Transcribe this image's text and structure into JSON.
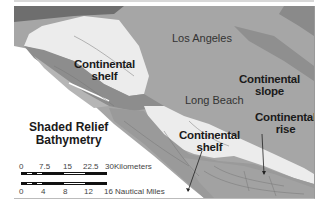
{
  "map": {
    "title_line1": "Shaded Relief",
    "title_line2": "Bathymetry",
    "labels": {
      "los_angeles": "Los Angeles",
      "long_beach": "Long Beach",
      "shelf_north_1": "Continental",
      "shelf_north_2": "shelf",
      "shelf_south_1": "Continental",
      "shelf_south_2": "shelf",
      "slope_1": "Continental",
      "slope_2": "slope",
      "rise_1": "Continental",
      "rise_2": "rise"
    },
    "scale_km": {
      "ticks": [
        "0",
        "7.5",
        "15",
        "22.5",
        "30"
      ],
      "unit": "Kilometers"
    },
    "scale_nm": {
      "ticks": [
        "0",
        "4",
        "8",
        "12",
        "16"
      ],
      "unit": "Nautical Miles"
    },
    "colors": {
      "land": "#a9a9a9",
      "shelf": "#ececec",
      "ocean_white": "#ffffff",
      "relief_dark": "#6e6e6e"
    }
  }
}
